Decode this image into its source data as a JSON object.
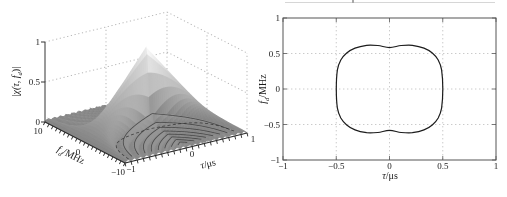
{
  "figure": {
    "description_visible": false
  },
  "chart_data": [
    {
      "type": "surface_3d",
      "title": "",
      "zlabel": {
        "var": "|χ(τ, f",
        "sub": "d",
        "post": ")|"
      },
      "ylabel": {
        "var": "f",
        "sub": "d",
        "post": "/MHz"
      },
      "xlabel": {
        "var": "τ",
        "sub": "",
        "post": "/μs"
      },
      "z_ticks": [
        {
          "v": 1,
          "label": "1"
        },
        {
          "v": 0.5,
          "label": "0.5"
        },
        {
          "v": 0,
          "label": "0"
        }
      ],
      "y_ticks": [
        {
          "v": 10,
          "label": "10"
        },
        {
          "v": 0,
          "label": "0"
        },
        {
          "v": -10,
          "label": "−10"
        }
      ],
      "x_ticks": [
        {
          "v": -1,
          "label": "−1"
        },
        {
          "v": 0,
          "label": "0"
        },
        {
          "v": 1,
          "label": "1"
        }
      ],
      "x_range_us": [
        -1,
        1
      ],
      "y_range_mhz": [
        -10,
        10
      ],
      "z_range": [
        0,
        1
      ],
      "surface_formula": "|χ(τ,fd)| = (1−|τ|)·|sinc(fd·(1−|τ|))| , pulse width T = 1 μs",
      "peak": {
        "tau_us": 0,
        "fd_mhz": 0,
        "value": 1
      },
      "sidelobe_ridge_orders": [
        1,
        2,
        3,
        4,
        5,
        6,
        7,
        8
      ],
      "first_null": {
        "product": 1,
        "style": "dashed"
      },
      "grid": "dotted back walls at z=0.5, z=1, τ=0, fd=0",
      "colors": {
        "surface_low": "#8c8c8c",
        "surface_high": "#f4f4f4",
        "grid": "#b0b0b0",
        "axis": "#333333",
        "ring": "#3c3c3c",
        "edge": "#2a2a2a"
      }
    },
    {
      "type": "contour",
      "title": "",
      "ylabel": {
        "var": "f",
        "sub": "d",
        "post": "/MHz"
      },
      "xlabel": {
        "var": "τ",
        "sub": "",
        "post": "/μs"
      },
      "x_ticks": [
        {
          "v": -1,
          "label": "−1"
        },
        {
          "v": -0.5,
          "label": "−0.5"
        },
        {
          "v": 0,
          "label": "0"
        },
        {
          "v": 0.5,
          "label": "0.5"
        },
        {
          "v": 1,
          "label": "1"
        }
      ],
      "y_ticks": [
        {
          "v": 1,
          "label": "1"
        },
        {
          "v": 0.5,
          "label": "0.5"
        },
        {
          "v": 0,
          "label": "0"
        },
        {
          "v": -0.5,
          "label": "−0.5"
        },
        {
          "v": -1,
          "label": "−1"
        }
      ],
      "x_range": [
        -1,
        1
      ],
      "y_range": [
        -1,
        1
      ],
      "grid": "dotted at ±0.5 and 0",
      "contour_level_extent": {
        "tau_max_us": 0.5,
        "fd_max_mhz": 0.63,
        "fd_at_tau0_mhz": 0.583
      },
      "contour_points": [
        [
          0.5,
          0
        ],
        [
          0.489,
          0.271
        ],
        [
          0.457,
          0.408
        ],
        [
          0.402,
          0.507
        ],
        [
          0.324,
          0.576
        ],
        [
          0.215,
          0.615
        ],
        [
          0.109,
          0.612
        ],
        [
          0,
          0.583
        ],
        [
          -0.109,
          0.612
        ],
        [
          -0.215,
          0.615
        ],
        [
          -0.324,
          0.576
        ],
        [
          -0.402,
          0.507
        ],
        [
          -0.457,
          0.408
        ],
        [
          -0.489,
          0.271
        ],
        [
          -0.5,
          0
        ],
        [
          -0.489,
          -0.271
        ],
        [
          -0.457,
          -0.408
        ],
        [
          -0.402,
          -0.507
        ],
        [
          -0.324,
          -0.576
        ],
        [
          -0.215,
          -0.615
        ],
        [
          -0.109,
          -0.612
        ],
        [
          0,
          -0.583
        ],
        [
          0.109,
          -0.612
        ],
        [
          0.215,
          -0.615
        ],
        [
          0.324,
          -0.576
        ],
        [
          0.402,
          -0.507
        ],
        [
          0.457,
          -0.408
        ],
        [
          0.489,
          -0.271
        ]
      ],
      "colors": {
        "contour": "#1c1c1c",
        "grid": "#c4c4c4",
        "axis": "#555555"
      }
    }
  ]
}
